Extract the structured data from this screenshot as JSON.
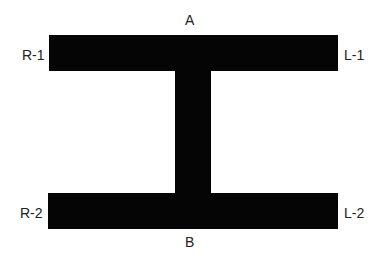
{
  "diagram": {
    "shape": "I-beam / H cross-section",
    "fill_color": "#050505",
    "background": "#ffffff",
    "labels": {
      "top": "A",
      "bottom": "B",
      "top_left": "R-1",
      "top_right": "L-1",
      "bottom_left": "R-2",
      "bottom_right": "L-2"
    },
    "parts": {
      "top_flange": {
        "x": 49,
        "y": 35,
        "w": 289,
        "h": 36
      },
      "web": {
        "x": 175,
        "y": 71,
        "w": 36,
        "h": 122
      },
      "bottom_flange": {
        "x": 48,
        "y": 193,
        "w": 290,
        "h": 36
      }
    }
  }
}
